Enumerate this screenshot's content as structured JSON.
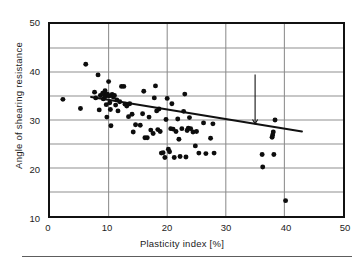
{
  "chart_data": {
    "type": "scatter",
    "title": "",
    "xlabel": "Plasticity index [%]",
    "ylabel": "Angle of shearing resistance",
    "xlim": [
      0,
      50
    ],
    "ylim": [
      10,
      50
    ],
    "xticks": [
      0,
      10,
      20,
      30,
      40,
      50
    ],
    "yticks": [
      10,
      20,
      30,
      40,
      50
    ],
    "x_minor_step": 5,
    "y_minor_step": 5,
    "grid": "major and minor gridlines, gray",
    "grid_color": "#8c8c8c",
    "frame_color": "#111111",
    "marker_color": "#0d0d0d",
    "marker_shape": "filled-circle",
    "legend": "none",
    "annotations": [
      {
        "text_line1": "Terzaghi, Peck and Mesri (1996)",
        "text_line2": "for various soils",
        "arrow_from_x": 35,
        "arrow_from_y": 39.5,
        "arrow_to_x": 35,
        "arrow_to_y": 29.2
      }
    ],
    "series": [
      {
        "name": "Terzaghi, Peck and Mesri (1996) trend for various soils",
        "type": "line",
        "color": "#111111",
        "x": [
          7.0,
          43.0
        ],
        "y": [
          34.8,
          27.6
        ]
      },
      {
        "name": "Measured soils",
        "type": "scatter",
        "points": [
          [
            2.2,
            34.3
          ],
          [
            5.2,
            32.4
          ],
          [
            6.1,
            41.6
          ],
          [
            7.6,
            35.8
          ],
          [
            7.8,
            34.6
          ],
          [
            8.2,
            39.4
          ],
          [
            8.4,
            32.1
          ],
          [
            8.6,
            35.1
          ],
          [
            9.0,
            35.6
          ],
          [
            9.1,
            34.4
          ],
          [
            9.3,
            35.2
          ],
          [
            9.4,
            36.1
          ],
          [
            9.5,
            34.9
          ],
          [
            9.6,
            33.2
          ],
          [
            9.7,
            30.6
          ],
          [
            9.8,
            35.4
          ],
          [
            10.0,
            38.0
          ],
          [
            10.1,
            35.0
          ],
          [
            10.2,
            33.6
          ],
          [
            10.3,
            32.2
          ],
          [
            10.4,
            28.8
          ],
          [
            10.6,
            35.3
          ],
          [
            10.8,
            34.8
          ],
          [
            11.0,
            35.1
          ],
          [
            11.2,
            33.1
          ],
          [
            11.4,
            34.2
          ],
          [
            11.6,
            31.9
          ],
          [
            11.9,
            33.8
          ],
          [
            12.2,
            37.0
          ],
          [
            12.6,
            37.0
          ],
          [
            12.8,
            33.3
          ],
          [
            13.1,
            32.9
          ],
          [
            13.4,
            30.7
          ],
          [
            13.6,
            33.4
          ],
          [
            14.0,
            31.2
          ],
          [
            14.2,
            27.5
          ],
          [
            14.6,
            29.0
          ],
          [
            15.4,
            28.9
          ],
          [
            15.8,
            31.3
          ],
          [
            16.0,
            36.0
          ],
          [
            16.2,
            26.3
          ],
          [
            16.6,
            26.3
          ],
          [
            16.9,
            30.6
          ],
          [
            17.2,
            27.9
          ],
          [
            17.6,
            27.2
          ],
          [
            17.8,
            34.6
          ],
          [
            18.0,
            37.1
          ],
          [
            18.2,
            31.9
          ],
          [
            18.4,
            28.0
          ],
          [
            18.6,
            32.3
          ],
          [
            18.8,
            27.6
          ],
          [
            19.0,
            23.1
          ],
          [
            19.3,
            23.2
          ],
          [
            19.6,
            22.2
          ],
          [
            19.8,
            30.1
          ],
          [
            20.0,
            34.5
          ],
          [
            20.2,
            23.9
          ],
          [
            20.4,
            23.4
          ],
          [
            20.6,
            28.2
          ],
          [
            20.8,
            33.4
          ],
          [
            21.0,
            28.1
          ],
          [
            21.2,
            22.2
          ],
          [
            21.5,
            27.6
          ],
          [
            21.8,
            30.2
          ],
          [
            22.0,
            26.0
          ],
          [
            22.2,
            22.4
          ],
          [
            22.5,
            28.2
          ],
          [
            22.8,
            31.8
          ],
          [
            23.0,
            35.4
          ],
          [
            23.2,
            22.3
          ],
          [
            23.4,
            27.8
          ],
          [
            23.6,
            28.3
          ],
          [
            23.8,
            30.5
          ],
          [
            24.0,
            28.2
          ],
          [
            24.4,
            27.5
          ],
          [
            24.8,
            24.6
          ],
          [
            25.0,
            27.6
          ],
          [
            25.4,
            23.1
          ],
          [
            26.2,
            29.4
          ],
          [
            26.6,
            23.0
          ],
          [
            27.4,
            26.2
          ],
          [
            27.8,
            29.2
          ],
          [
            28.0,
            23.1
          ],
          [
            36.2,
            22.8
          ],
          [
            36.3,
            20.2
          ],
          [
            37.9,
            26.4
          ],
          [
            38.0,
            26.9
          ],
          [
            38.1,
            27.5
          ],
          [
            38.2,
            22.8
          ],
          [
            38.4,
            30.0
          ],
          [
            40.2,
            13.2
          ]
        ]
      }
    ]
  },
  "axes": {
    "y_labels": [
      "50",
      "40",
      "30",
      "20",
      "10"
    ],
    "x_labels": [
      "0",
      "10",
      "20",
      "30",
      "40",
      "50"
    ],
    "x_title": "Plasticity index [%]",
    "y_title": "Angle of shearing resistance"
  },
  "annotation": {
    "line1": "Terzaghi, Peck and Mesri (1996)",
    "line2": "for various soils"
  }
}
